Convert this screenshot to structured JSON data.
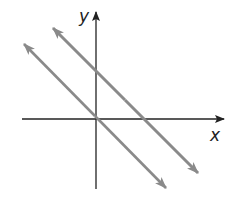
{
  "figure": {
    "type": "coordinate-plane",
    "axes": {
      "x_label": "x",
      "y_label": "y",
      "axis_color": "#222222"
    },
    "lines": [
      {
        "name": "line-through-origin",
        "description": "passes through origin, slope -1",
        "color": "#8a8a8a",
        "x1": 24,
        "y1": 44,
        "x2": 166,
        "y2": 188
      },
      {
        "name": "line-upper",
        "description": "parallel line, positive y-intercept, slope -1",
        "color": "#8a8a8a",
        "x1": 53,
        "y1": 28,
        "x2": 198,
        "y2": 173
      }
    ],
    "relationship": "parallel"
  }
}
